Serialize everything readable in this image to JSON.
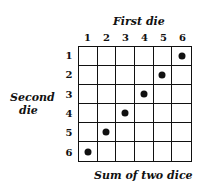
{
  "title_top": "First die",
  "title_left_line1": "Second",
  "title_left_line2": "die",
  "caption": "Sum of two dice",
  "columns": [
    "1",
    "2",
    "3",
    "4",
    "5",
    "6"
  ],
  "rows": [
    "1",
    "2",
    "3",
    "4",
    "5",
    "6"
  ],
  "dots": [
    [
      1,
      6
    ],
    [
      2,
      5
    ],
    [
      3,
      4
    ],
    [
      4,
      3
    ],
    [
      5,
      2
    ],
    [
      6,
      1
    ]
  ],
  "colors": {
    "ink": "#111111",
    "background": "#ffffff"
  }
}
